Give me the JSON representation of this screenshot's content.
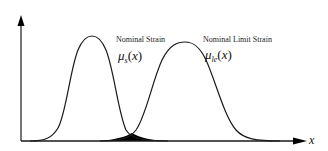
{
  "diagram": {
    "type": "overlapping-distributions",
    "axes": {
      "x_label": "x",
      "y_label": ""
    },
    "curves": [
      {
        "id": "nominal-strain",
        "title": "Nominal Strain",
        "symbol": "μ",
        "subscript": "s",
        "argument": "x",
        "peak_x_px": 92
      },
      {
        "id": "nominal-limit-strain",
        "title": "Nominal Limit Strain",
        "symbol": "μ",
        "subscript": "le",
        "argument": "x",
        "peak_x_px": 185
      }
    ],
    "overlap_region": {
      "fill": "#000000",
      "description": "shaded intersection of the two distributions"
    }
  },
  "colors": {
    "line": "#1a1a1a",
    "fill": "#000000",
    "background": "#ffffff"
  }
}
